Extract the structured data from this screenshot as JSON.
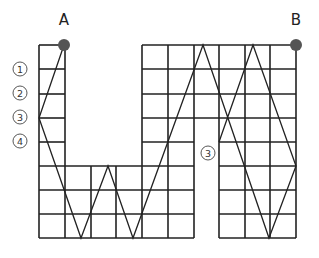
{
  "diagram": {
    "points": [
      {
        "label": "A",
        "x": 64,
        "y": 45
      },
      {
        "label": "B",
        "x": 296,
        "y": 45
      }
    ],
    "point_color": "#555555",
    "line_color": "#222222",
    "row_markers": [
      {
        "label": "①",
        "x": 19,
        "y": 69
      },
      {
        "label": "②",
        "x": 19,
        "y": 93
      },
      {
        "label": "③",
        "x": 19,
        "y": 117
      },
      {
        "label": "④",
        "x": 19,
        "y": 141
      },
      {
        "label": "③",
        "x": 206,
        "y": 152
      }
    ],
    "grid": {
      "columns_x": [
        39,
        65,
        91,
        116,
        142,
        168,
        194,
        219,
        245,
        270,
        296
      ],
      "rows_y": [
        45,
        69,
        94,
        118,
        142,
        166,
        190,
        214,
        238
      ]
    },
    "zigzag_path": [
      [
        64,
        45
      ],
      [
        39,
        118
      ],
      [
        81,
        238
      ],
      [
        108,
        166
      ],
      [
        133,
        238
      ],
      [
        203,
        45
      ],
      [
        269,
        238
      ],
      [
        296,
        166
      ],
      [
        253,
        45
      ],
      [
        219,
        142
      ]
    ]
  }
}
